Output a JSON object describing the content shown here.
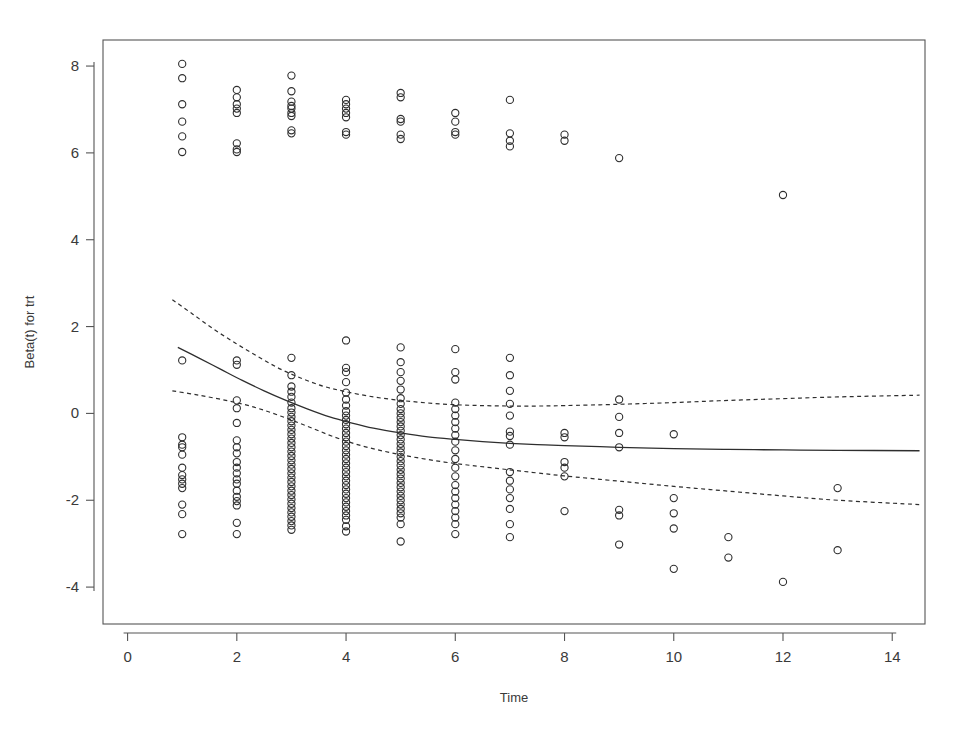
{
  "chart_data": {
    "type": "scatter",
    "title": "",
    "subtitle": "",
    "xlabel": "Time",
    "ylabel": "Beta(t) for trt",
    "xlim": [
      -0.45,
      14.6
    ],
    "ylim": [
      -4.85,
      8.6
    ],
    "xticks": [
      0,
      2,
      4,
      6,
      8,
      10,
      12,
      14
    ],
    "xtick_labels": [
      "0",
      "2",
      "4",
      "6",
      "8",
      "10",
      "12",
      "14"
    ],
    "yticks": [
      8,
      6,
      4,
      2,
      0,
      -2,
      -4
    ],
    "ytick_labels": [
      "8",
      "6",
      "4",
      "2",
      "0",
      "-2",
      "-4"
    ],
    "grid": false,
    "legend": null,
    "box": true,
    "marker": {
      "shape": "open-circle",
      "radius": 3.6,
      "stroke": "#2e2e2e",
      "stroke_width": 1.1,
      "fill": "none"
    },
    "axis_color": "#555555",
    "series": [
      {
        "name": "Scaled Schoenfeld residuals",
        "type": "scatter",
        "points": [
          [
            1,
            8.05
          ],
          [
            1,
            7.72
          ],
          [
            1,
            7.12
          ],
          [
            1,
            6.72
          ],
          [
            1,
            6.38
          ],
          [
            1,
            6.02
          ],
          [
            1,
            1.22
          ],
          [
            1,
            -0.55
          ],
          [
            1,
            -0.72
          ],
          [
            1,
            -0.78
          ],
          [
            1,
            -0.95
          ],
          [
            1,
            -1.25
          ],
          [
            1,
            -1.42
          ],
          [
            1,
            -1.52
          ],
          [
            1,
            -1.62
          ],
          [
            1,
            -1.72
          ],
          [
            1,
            -2.1
          ],
          [
            1,
            -2.32
          ],
          [
            1,
            -2.78
          ],
          [
            2,
            7.45
          ],
          [
            2,
            7.28
          ],
          [
            2,
            7.12
          ],
          [
            2,
            7.02
          ],
          [
            2,
            6.92
          ],
          [
            2,
            6.22
          ],
          [
            2,
            6.08
          ],
          [
            2,
            6.02
          ],
          [
            2,
            1.22
          ],
          [
            2,
            1.12
          ],
          [
            2,
            0.3
          ],
          [
            2,
            0.12
          ],
          [
            2,
            -0.22
          ],
          [
            2,
            -0.62
          ],
          [
            2,
            -0.78
          ],
          [
            2,
            -0.92
          ],
          [
            2,
            -1.12
          ],
          [
            2,
            -1.25
          ],
          [
            2,
            -1.38
          ],
          [
            2,
            -1.52
          ],
          [
            2,
            -1.62
          ],
          [
            2,
            -1.78
          ],
          [
            2,
            -1.92
          ],
          [
            2,
            -2.02
          ],
          [
            2,
            -2.12
          ],
          [
            2,
            -2.52
          ],
          [
            2,
            -2.78
          ],
          [
            3,
            7.78
          ],
          [
            3,
            7.42
          ],
          [
            3,
            7.18
          ],
          [
            3,
            7.08
          ],
          [
            3,
            7.02
          ],
          [
            3,
            6.92
          ],
          [
            3,
            6.85
          ],
          [
            3,
            6.52
          ],
          [
            3,
            6.45
          ],
          [
            3,
            1.28
          ],
          [
            3,
            0.88
          ],
          [
            3,
            0.62
          ],
          [
            3,
            0.5
          ],
          [
            3,
            0.38
          ],
          [
            3,
            0.25
          ],
          [
            3,
            0.12
          ],
          [
            3,
            0.02
          ],
          [
            3,
            -0.08
          ],
          [
            3,
            -0.18
          ],
          [
            3,
            -0.28
          ],
          [
            3,
            -0.38
          ],
          [
            3,
            -0.48
          ],
          [
            3,
            -0.58
          ],
          [
            3,
            -0.68
          ],
          [
            3,
            -0.78
          ],
          [
            3,
            -0.88
          ],
          [
            3,
            -0.98
          ],
          [
            3,
            -1.08
          ],
          [
            3,
            -1.18
          ],
          [
            3,
            -1.28
          ],
          [
            3,
            -1.38
          ],
          [
            3,
            -1.48
          ],
          [
            3,
            -1.58
          ],
          [
            3,
            -1.68
          ],
          [
            3,
            -1.78
          ],
          [
            3,
            -1.88
          ],
          [
            3,
            -1.98
          ],
          [
            3,
            -2.08
          ],
          [
            3,
            -2.18
          ],
          [
            3,
            -2.28
          ],
          [
            3,
            -2.38
          ],
          [
            3,
            -2.48
          ],
          [
            3,
            -2.58
          ],
          [
            3,
            -2.68
          ],
          [
            4,
            7.22
          ],
          [
            4,
            7.12
          ],
          [
            4,
            7.02
          ],
          [
            4,
            6.92
          ],
          [
            4,
            6.82
          ],
          [
            4,
            6.48
          ],
          [
            4,
            6.42
          ],
          [
            4,
            1.68
          ],
          [
            4,
            1.05
          ],
          [
            4,
            0.95
          ],
          [
            4,
            0.72
          ],
          [
            4,
            0.48
          ],
          [
            4,
            0.32
          ],
          [
            4,
            0.18
          ],
          [
            4,
            0.05
          ],
          [
            4,
            -0.05
          ],
          [
            4,
            -0.15
          ],
          [
            4,
            -0.25
          ],
          [
            4,
            -0.35
          ],
          [
            4,
            -0.45
          ],
          [
            4,
            -0.55
          ],
          [
            4,
            -0.65
          ],
          [
            4,
            -0.75
          ],
          [
            4,
            -0.85
          ],
          [
            4,
            -0.95
          ],
          [
            4,
            -1.05
          ],
          [
            4,
            -1.15
          ],
          [
            4,
            -1.25
          ],
          [
            4,
            -1.35
          ],
          [
            4,
            -1.45
          ],
          [
            4,
            -1.55
          ],
          [
            4,
            -1.65
          ],
          [
            4,
            -1.75
          ],
          [
            4,
            -1.85
          ],
          [
            4,
            -1.95
          ],
          [
            4,
            -2.05
          ],
          [
            4,
            -2.15
          ],
          [
            4,
            -2.25
          ],
          [
            4,
            -2.35
          ],
          [
            4,
            -2.45
          ],
          [
            4,
            -2.6
          ],
          [
            4,
            -2.72
          ],
          [
            5,
            7.38
          ],
          [
            5,
            7.28
          ],
          [
            5,
            6.78
          ],
          [
            5,
            6.72
          ],
          [
            5,
            6.42
          ],
          [
            5,
            6.32
          ],
          [
            5,
            1.52
          ],
          [
            5,
            1.18
          ],
          [
            5,
            0.95
          ],
          [
            5,
            0.75
          ],
          [
            5,
            0.55
          ],
          [
            5,
            0.35
          ],
          [
            5,
            0.22
          ],
          [
            5,
            0.1
          ],
          [
            5,
            0.0
          ],
          [
            5,
            -0.1
          ],
          [
            5,
            -0.2
          ],
          [
            5,
            -0.3
          ],
          [
            5,
            -0.4
          ],
          [
            5,
            -0.5
          ],
          [
            5,
            -0.6
          ],
          [
            5,
            -0.7
          ],
          [
            5,
            -0.8
          ],
          [
            5,
            -0.9
          ],
          [
            5,
            -1.0
          ],
          [
            5,
            -1.1
          ],
          [
            5,
            -1.2
          ],
          [
            5,
            -1.3
          ],
          [
            5,
            -1.4
          ],
          [
            5,
            -1.5
          ],
          [
            5,
            -1.6
          ],
          [
            5,
            -1.7
          ],
          [
            5,
            -1.8
          ],
          [
            5,
            -1.9
          ],
          [
            5,
            -2.0
          ],
          [
            5,
            -2.1
          ],
          [
            5,
            -2.2
          ],
          [
            5,
            -2.3
          ],
          [
            5,
            -2.4
          ],
          [
            5,
            -2.55
          ],
          [
            5,
            -2.95
          ],
          [
            6,
            6.92
          ],
          [
            6,
            6.72
          ],
          [
            6,
            6.48
          ],
          [
            6,
            6.42
          ],
          [
            6,
            1.48
          ],
          [
            6,
            0.95
          ],
          [
            6,
            0.78
          ],
          [
            6,
            0.25
          ],
          [
            6,
            0.1
          ],
          [
            6,
            -0.05
          ],
          [
            6,
            -0.2
          ],
          [
            6,
            -0.35
          ],
          [
            6,
            -0.5
          ],
          [
            6,
            -0.65
          ],
          [
            6,
            -0.85
          ],
          [
            6,
            -1.05
          ],
          [
            6,
            -1.25
          ],
          [
            6,
            -1.45
          ],
          [
            6,
            -1.65
          ],
          [
            6,
            -1.8
          ],
          [
            6,
            -1.95
          ],
          [
            6,
            -2.1
          ],
          [
            6,
            -2.25
          ],
          [
            6,
            -2.4
          ],
          [
            6,
            -2.55
          ],
          [
            6,
            -2.78
          ],
          [
            7,
            7.22
          ],
          [
            7,
            6.45
          ],
          [
            7,
            6.28
          ],
          [
            7,
            6.15
          ],
          [
            7,
            1.28
          ],
          [
            7,
            0.88
          ],
          [
            7,
            0.52
          ],
          [
            7,
            0.22
          ],
          [
            7,
            -0.05
          ],
          [
            7,
            -0.42
          ],
          [
            7,
            -0.52
          ],
          [
            7,
            -0.72
          ],
          [
            7,
            -1.35
          ],
          [
            7,
            -1.55
          ],
          [
            7,
            -1.75
          ],
          [
            7,
            -1.95
          ],
          [
            7,
            -2.2
          ],
          [
            7,
            -2.55
          ],
          [
            7,
            -2.85
          ],
          [
            8,
            6.42
          ],
          [
            8,
            6.28
          ],
          [
            8,
            -0.45
          ],
          [
            8,
            -0.55
          ],
          [
            8,
            -1.12
          ],
          [
            8,
            -1.25
          ],
          [
            8,
            -1.45
          ],
          [
            8,
            -2.25
          ],
          [
            9,
            5.88
          ],
          [
            9,
            0.32
          ],
          [
            9,
            -0.08
          ],
          [
            9,
            -0.45
          ],
          [
            9,
            -0.78
          ],
          [
            9,
            -2.22
          ],
          [
            9,
            -2.35
          ],
          [
            9,
            -3.02
          ],
          [
            10,
            -0.48
          ],
          [
            10,
            -1.95
          ],
          [
            10,
            -2.3
          ],
          [
            10,
            -2.65
          ],
          [
            10,
            -3.58
          ],
          [
            11,
            -2.85
          ],
          [
            11,
            -3.32
          ],
          [
            12,
            5.03
          ],
          [
            12,
            -3.88
          ],
          [
            13,
            -1.72
          ],
          [
            13,
            -3.15
          ]
        ]
      }
    ],
    "lines": [
      {
        "name": "fitted-spline",
        "style": "solid",
        "color": "#2e2e2e",
        "width": 1.3,
        "points": [
          [
            0.92,
            1.52
          ],
          [
            1.3,
            1.28
          ],
          [
            1.7,
            1.02
          ],
          [
            2.1,
            0.76
          ],
          [
            2.5,
            0.52
          ],
          [
            2.9,
            0.3
          ],
          [
            3.3,
            0.1
          ],
          [
            3.7,
            -0.08
          ],
          [
            4.1,
            -0.22
          ],
          [
            4.5,
            -0.34
          ],
          [
            5.0,
            -0.45
          ],
          [
            5.5,
            -0.54
          ],
          [
            6.0,
            -0.6
          ],
          [
            6.5,
            -0.65
          ],
          [
            7.0,
            -0.69
          ],
          [
            7.5,
            -0.72
          ],
          [
            8.0,
            -0.74
          ],
          [
            9.0,
            -0.78
          ],
          [
            10.0,
            -0.81
          ],
          [
            11.0,
            -0.83
          ],
          [
            12.0,
            -0.84
          ],
          [
            13.0,
            -0.85
          ],
          [
            14.5,
            -0.86
          ]
        ]
      },
      {
        "name": "upper-confidence-band",
        "style": "dashed",
        "color": "#2e2e2e",
        "width": 1.2,
        "points": [
          [
            0.82,
            2.62
          ],
          [
            1.2,
            2.28
          ],
          [
            1.6,
            1.92
          ],
          [
            2.0,
            1.6
          ],
          [
            2.4,
            1.3
          ],
          [
            2.8,
            1.02
          ],
          [
            3.2,
            0.8
          ],
          [
            3.6,
            0.62
          ],
          [
            4.0,
            0.5
          ],
          [
            4.5,
            0.38
          ],
          [
            5.0,
            0.3
          ],
          [
            5.5,
            0.24
          ],
          [
            6.0,
            0.2
          ],
          [
            6.5,
            0.18
          ],
          [
            7.0,
            0.17
          ],
          [
            7.5,
            0.17
          ],
          [
            8.0,
            0.18
          ],
          [
            9.0,
            0.21
          ],
          [
            10.0,
            0.25
          ],
          [
            11.0,
            0.3
          ],
          [
            12.0,
            0.34
          ],
          [
            13.0,
            0.38
          ],
          [
            14.5,
            0.42
          ]
        ]
      },
      {
        "name": "lower-confidence-band",
        "style": "dashed",
        "color": "#2e2e2e",
        "width": 1.2,
        "points": [
          [
            0.82,
            0.52
          ],
          [
            1.3,
            0.42
          ],
          [
            1.8,
            0.3
          ],
          [
            2.3,
            0.15
          ],
          [
            2.8,
            -0.06
          ],
          [
            3.3,
            -0.3
          ],
          [
            3.8,
            -0.55
          ],
          [
            4.3,
            -0.75
          ],
          [
            4.8,
            -0.9
          ],
          [
            5.3,
            -1.02
          ],
          [
            5.8,
            -1.12
          ],
          [
            6.3,
            -1.2
          ],
          [
            7.0,
            -1.3
          ],
          [
            7.5,
            -1.37
          ],
          [
            8.0,
            -1.44
          ],
          [
            9.0,
            -1.56
          ],
          [
            10.0,
            -1.68
          ],
          [
            11.0,
            -1.79
          ],
          [
            12.0,
            -1.9
          ],
          [
            13.0,
            -2.0
          ],
          [
            14.5,
            -2.1
          ]
        ]
      }
    ]
  },
  "figure": {
    "background_color": "#ffffff",
    "plot_area": {
      "left": 103,
      "top": 40,
      "right": 925,
      "bottom": 624
    }
  }
}
